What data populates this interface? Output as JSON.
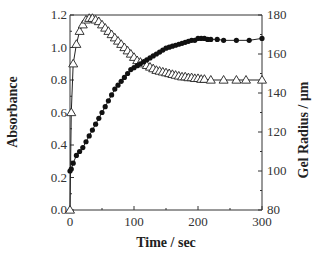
{
  "chart_data": {
    "type": "line",
    "title": "",
    "xlabel": "Time / sec",
    "ylabel": "Absorbance",
    "y2label": "Gel Radius / μm",
    "xlim": [
      0,
      300
    ],
    "ylim": [
      0.0,
      1.2
    ],
    "y2lim": [
      80,
      180
    ],
    "xticks": [
      0,
      100,
      200,
      300
    ],
    "xtick_labels": [
      "0",
      "100",
      "200",
      "300"
    ],
    "yticks": [
      0.0,
      0.2,
      0.4,
      0.6,
      0.8,
      1.0,
      1.2
    ],
    "ytick_labels": [
      "0.0",
      "0.2",
      "0.4",
      "0.6",
      "0.8",
      "1.0",
      "1.2"
    ],
    "y2ticks": [
      80,
      100,
      120,
      140,
      160,
      180
    ],
    "y2tick_labels": [
      "80",
      "100",
      "120",
      "140",
      "160",
      "180"
    ],
    "grid": false,
    "legend": "none",
    "series": [
      {
        "name": "Absorbance",
        "axis": "left",
        "marker": "open-triangle",
        "x": [
          0,
          2,
          5,
          10,
          15,
          20,
          25,
          30,
          35,
          40,
          45,
          50,
          55,
          60,
          65,
          70,
          75,
          80,
          85,
          90,
          95,
          100,
          105,
          110,
          115,
          120,
          125,
          130,
          135,
          140,
          145,
          150,
          155,
          160,
          165,
          170,
          175,
          180,
          185,
          190,
          195,
          200,
          205,
          210,
          220,
          240,
          260,
          275,
          300
        ],
        "values": [
          0.0,
          0.6,
          0.9,
          1.02,
          1.1,
          1.14,
          1.17,
          1.18,
          1.18,
          1.17,
          1.16,
          1.14,
          1.12,
          1.1,
          1.08,
          1.06,
          1.04,
          1.02,
          1.0,
          0.98,
          0.96,
          0.94,
          0.92,
          0.91,
          0.9,
          0.89,
          0.88,
          0.87,
          0.86,
          0.855,
          0.85,
          0.845,
          0.84,
          0.835,
          0.83,
          0.825,
          0.82,
          0.82,
          0.815,
          0.815,
          0.81,
          0.81,
          0.805,
          0.805,
          0.8,
          0.8,
          0.8,
          0.8,
          0.8
        ]
      },
      {
        "name": "Gel Radius",
        "axis": "right",
        "marker": "filled-circle",
        "x": [
          0,
          2,
          5,
          10,
          15,
          20,
          25,
          30,
          35,
          40,
          45,
          50,
          55,
          60,
          65,
          70,
          75,
          80,
          85,
          90,
          95,
          100,
          105,
          110,
          115,
          120,
          125,
          130,
          135,
          140,
          145,
          150,
          155,
          160,
          165,
          170,
          175,
          180,
          185,
          190,
          195,
          200,
          205,
          210,
          215,
          220,
          230,
          240,
          260,
          280,
          300
        ],
        "values": [
          100,
          101,
          104,
          108,
          110,
          112,
          115,
          118,
          121,
          124,
          127,
          130,
          133,
          136,
          139,
          142,
          144,
          146,
          148,
          150,
          152,
          153,
          154,
          155,
          156,
          157,
          158,
          159,
          160,
          161,
          162,
          163,
          163.5,
          164,
          164.5,
          165,
          165.5,
          166,
          166.5,
          167,
          167,
          168,
          168,
          168,
          167.5,
          167.5,
          167.5,
          167,
          167,
          167,
          168
        ]
      }
    ]
  }
}
